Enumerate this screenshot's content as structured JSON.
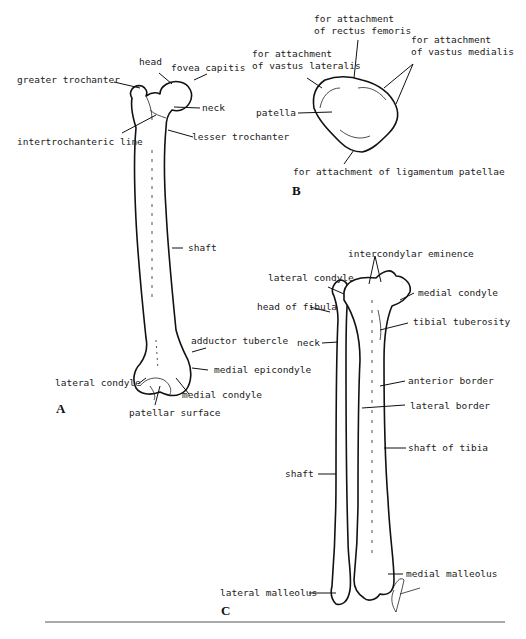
{
  "figure": {
    "panels": [
      {
        "id": "A",
        "subject": "femur",
        "labels": [
          "head",
          "fovea capitis",
          "greater trochanter",
          "neck",
          "intertrochanteric line",
          "lesser trochanter",
          "shaft",
          "adductor tubercle",
          "medial epicondyle",
          "lateral condyle",
          "medial condyle",
          "patellar surface"
        ]
      },
      {
        "id": "B",
        "subject": "patella",
        "labels": [
          "for attachment\nof rectus femoris",
          "for attachment\nof vastus lateralis",
          "for attachment\nof vastus medialis",
          "patella",
          "for attachment of ligamentum patellae"
        ]
      },
      {
        "id": "C",
        "subject": "tibia and fibula",
        "labels": [
          "intercondylar eminence",
          "lateral condyle",
          "medial condyle",
          "head of fibula",
          "tibial tuberosity",
          "neck",
          "anterior border",
          "lateral border",
          "shaft of tibia",
          "shaft",
          "medial malleolus",
          "lateral malleolus"
        ]
      }
    ]
  }
}
